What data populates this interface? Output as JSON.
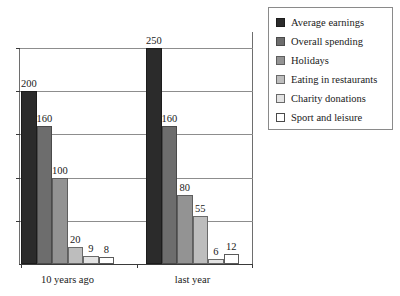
{
  "chart_data": {
    "type": "bar",
    "title": "",
    "subtitle": "",
    "xlabel": "",
    "ylabel": "",
    "categories": [
      "10 years ago",
      "last year"
    ],
    "series": [
      {
        "name": "Average earnings",
        "color": "#2b2b2b",
        "values": [
          200,
          250
        ]
      },
      {
        "name": "Overall spending",
        "color": "#6d6d6d",
        "values": [
          160,
          160
        ]
      },
      {
        "name": "Holidays",
        "color": "#939393",
        "values": [
          100,
          80
        ]
      },
      {
        "name": "Eating in restaurants",
        "color": "#bdbdbd",
        "values": [
          20,
          55
        ]
      },
      {
        "name": "Charity donations",
        "color": "#e3e3e3",
        "values": [
          9,
          6
        ]
      },
      {
        "name": "Sport and leisure",
        "color": "#ffffff",
        "values": [
          8,
          12
        ]
      }
    ],
    "ylim": [
      0,
      250
    ],
    "gridlines": [
      50,
      100,
      150,
      200,
      250
    ],
    "grid": true,
    "data_labels": true,
    "legend_position": "top-right",
    "tick_labels_y": []
  },
  "legend": {
    "entries": [
      {
        "label": "Average earnings"
      },
      {
        "label": "Overall spending"
      },
      {
        "label": "Holidays"
      },
      {
        "label": "Eating in restaurants"
      },
      {
        "label": "Charity donations"
      },
      {
        "label": "Sport and leisure"
      }
    ]
  },
  "axis": {
    "categories": [
      "10 years ago",
      "last year"
    ]
  },
  "labels": {
    "group0": [
      "200",
      "160",
      "100",
      "20",
      "9",
      "8"
    ],
    "group1": [
      "250",
      "160",
      "80",
      "55",
      "6",
      "12"
    ]
  }
}
